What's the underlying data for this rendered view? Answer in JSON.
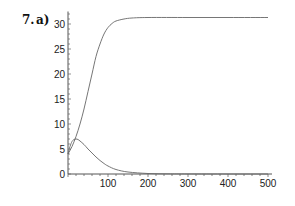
{
  "problem": {
    "number": "7.",
    "part": "a)"
  },
  "chart_data": {
    "type": "line",
    "title": "",
    "xlabel": "",
    "ylabel": "",
    "xlim": [
      0,
      500
    ],
    "ylim": [
      0,
      32
    ],
    "grid": false,
    "legend": null,
    "x_ticks": [
      0,
      100,
      200,
      300,
      400,
      500
    ],
    "y_ticks": [
      0,
      5,
      10,
      15,
      20,
      25,
      30
    ],
    "x_tick_labels": [
      "",
      "100",
      "200",
      "300",
      "400",
      "500"
    ],
    "y_tick_labels": [
      "0",
      "5",
      "10",
      "15",
      "20",
      "25",
      "30"
    ],
    "series": [
      {
        "name": "curve-1 (logistic growth)",
        "x": [
          0,
          10,
          20,
          30,
          40,
          50,
          60,
          70,
          80,
          90,
          100,
          110,
          120,
          140,
          160,
          200,
          300,
          400,
          500
        ],
        "y": [
          4,
          5.5,
          7.5,
          10,
          13,
          16.5,
          20,
          23.5,
          26,
          28,
          29.3,
          30.1,
          30.6,
          31.0,
          31.2,
          31.3,
          31.3,
          31.3,
          31.3
        ]
      },
      {
        "name": "curve-2 (rise and decay)",
        "x": [
          0,
          5,
          10,
          15,
          20,
          25,
          30,
          40,
          50,
          60,
          70,
          80,
          90,
          100,
          120,
          150,
          200,
          250,
          300,
          400,
          500
        ],
        "y": [
          4,
          5.5,
          6.5,
          6.9,
          7.0,
          6.9,
          6.6,
          5.9,
          5.0,
          4.2,
          3.4,
          2.7,
          2.1,
          1.6,
          0.9,
          0.4,
          0.1,
          0.03,
          0.01,
          0,
          0
        ]
      }
    ]
  }
}
